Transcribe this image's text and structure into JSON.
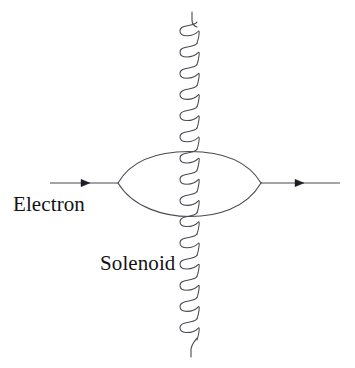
{
  "figure": {
    "background_color": "#ffffff",
    "stroke_color": "#4a4a52",
    "text_color": "#131313",
    "width": 355,
    "height": 368
  },
  "labels": {
    "electron": "Electron",
    "solenoid": "Solenoid"
  },
  "electron_path": {
    "incoming_line": {
      "x1": 50,
      "y1": 183,
      "x2": 118,
      "y2": 183,
      "arrow_at_x": 86,
      "direction": "right"
    },
    "outgoing_line": {
      "x1": 261,
      "y1": 183,
      "x2": 340,
      "y2": 183,
      "arrow_at_x": 300,
      "direction": "right"
    },
    "loop": {
      "left_vertex_x": 118,
      "right_vertex_x": 261,
      "vertex_y": 183,
      "top_y": 152,
      "bottom_y": 216
    }
  },
  "solenoid": {
    "axis_x": 197,
    "top_y": 12,
    "bottom_y": 356,
    "coil_start_y": 22,
    "coil_end_y": 340,
    "turns": 15,
    "turn_spacing": 21.2,
    "loop_radius_x": 13,
    "loop_radius_y": 8
  }
}
